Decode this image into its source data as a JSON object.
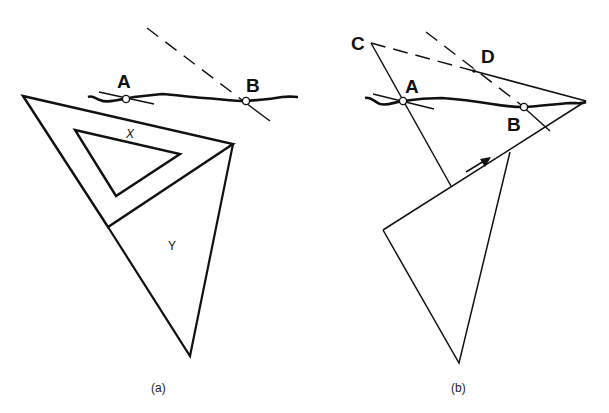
{
  "figure": {
    "panel_a": {
      "caption": "(a)",
      "labels": {
        "point_a": "A",
        "point_b": "B",
        "set_square": "X",
        "triangle": "Y"
      }
    },
    "panel_b": {
      "caption": "(b)",
      "labels": {
        "point_a": "A",
        "point_b": "B",
        "point_c": "C",
        "point_d": "D"
      }
    },
    "colors": {
      "stroke": "#111111",
      "background": "#ffffff"
    }
  }
}
